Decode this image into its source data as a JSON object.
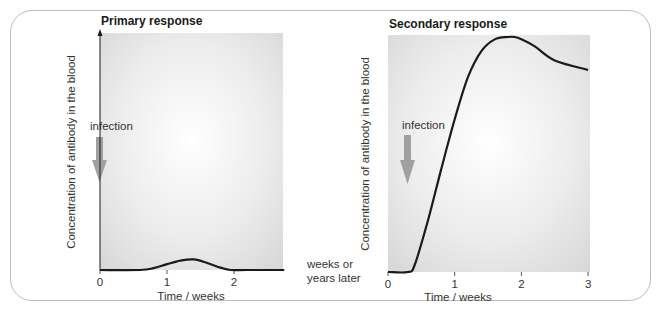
{
  "chart_data": [
    {
      "type": "line",
      "title": "Primary response",
      "xlabel": "Time / weeks",
      "ylabel": "Concentration of antibody in the blood",
      "xlim": [
        0,
        2.75
      ],
      "ylim": [
        0,
        1
      ],
      "xticks": [
        0,
        1,
        2
      ],
      "xtick_labels": [
        "0",
        "1",
        "2"
      ],
      "grid": false,
      "annotation": {
        "text": "infection",
        "x": 0
      },
      "series": [
        {
          "name": "antibody concentration",
          "x": [
            0,
            0.6,
            0.8,
            1.0,
            1.2,
            1.4,
            1.6,
            1.8,
            1.95,
            2.2,
            2.75
          ],
          "y": [
            0,
            0,
            0.008,
            0.025,
            0.04,
            0.045,
            0.03,
            0.01,
            0,
            0,
            0
          ]
        }
      ]
    },
    {
      "type": "line",
      "title": "Secondary response",
      "xlabel": "Time / weeks",
      "ylabel": "Concentration of antibody in the blood",
      "xlim": [
        0,
        3
      ],
      "ylim": [
        0,
        1
      ],
      "xticks": [
        0,
        1,
        2,
        3
      ],
      "xtick_labels": [
        "0",
        "1",
        "2",
        "3"
      ],
      "grid": false,
      "annotation": {
        "text": "infection",
        "x": 0.1
      },
      "series": [
        {
          "name": "antibody concentration",
          "x": [
            0,
            0.3,
            0.4,
            0.6,
            0.8,
            1.0,
            1.2,
            1.4,
            1.6,
            1.8,
            1.9,
            2.0,
            2.2,
            2.5,
            3.0
          ],
          "y": [
            0,
            0,
            0.03,
            0.22,
            0.44,
            0.65,
            0.83,
            0.94,
            0.99,
            1.0,
            1.0,
            0.99,
            0.96,
            0.9,
            0.86
          ]
        }
      ]
    }
  ],
  "between_label": [
    "weeks or",
    "years later"
  ],
  "colors": {
    "line": "#1a1a1a",
    "arrow": "#9e9e9e",
    "plot_bg_center": "#ffffff",
    "plot_bg_edge": "#d9d9d9",
    "frame": "#bdbdbd"
  }
}
